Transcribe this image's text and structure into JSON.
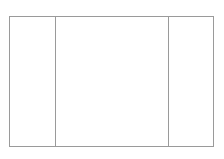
{
  "diagram": {
    "type": "three-column-layout-wireframe",
    "panels": [
      {
        "id": "left",
        "label": ""
      },
      {
        "id": "center",
        "label": ""
      },
      {
        "id": "right",
        "label": ""
      }
    ],
    "colors": {
      "stroke": "#9a9a9a",
      "background": "#ffffff"
    }
  }
}
